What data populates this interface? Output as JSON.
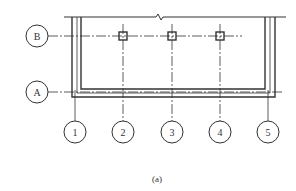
{
  "figure": {
    "caption": "(a)",
    "colors": {
      "line": "#333333",
      "background": "#ffffff"
    }
  },
  "axes": {
    "horizontal": [
      {
        "label": "B",
        "y": 36
      },
      {
        "label": "A",
        "y": 92
      }
    ],
    "vertical": [
      {
        "label": "1",
        "x": 75
      },
      {
        "label": "2",
        "x": 123
      },
      {
        "label": "3",
        "x": 172
      },
      {
        "label": "4",
        "x": 220
      },
      {
        "label": "5",
        "x": 268
      }
    ]
  },
  "columns": [
    {
      "axis_x": "2",
      "axis_y": "B"
    },
    {
      "axis_x": "3",
      "axis_y": "B"
    },
    {
      "axis_x": "4",
      "axis_y": "B"
    }
  ]
}
